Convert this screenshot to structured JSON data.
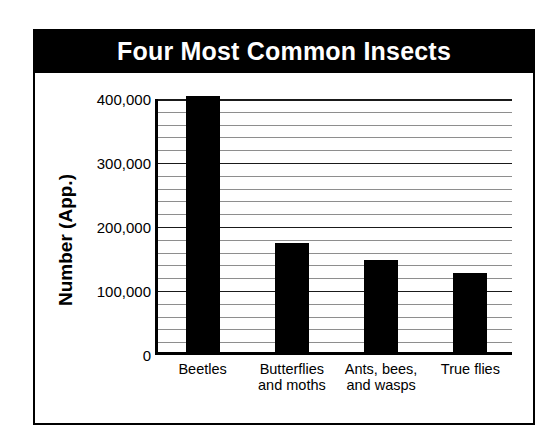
{
  "chart_data": {
    "type": "bar",
    "title": "Four Most Common Insects",
    "xlabel": "",
    "ylabel": "Number (App.)",
    "categories": [
      "Beetles",
      "Butterflies and moths",
      "Ants, bees, and wasps",
      "True flies"
    ],
    "category_lines": [
      [
        "Beetles"
      ],
      [
        "Butterflies",
        "and moths"
      ],
      [
        "Ants, bees,",
        "and wasps"
      ],
      [
        "True flies"
      ]
    ],
    "values": [
      400000,
      170000,
      144000,
      123000
    ],
    "ylim": [
      0,
      400000
    ],
    "yticks": [
      0,
      100000,
      200000,
      300000,
      400000
    ],
    "ytick_labels": [
      "0",
      "100,000",
      "200,000",
      "300,000",
      "400,000"
    ],
    "minor_tick_step": 20000,
    "grid": true,
    "legend": null,
    "bar_color": "#000000",
    "title_background": "#000000",
    "title_color": "#ffffff"
  }
}
